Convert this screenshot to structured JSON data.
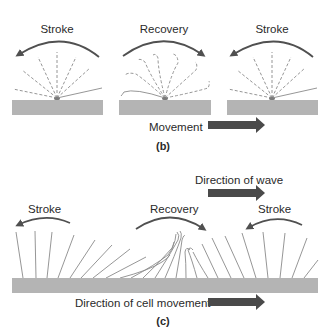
{
  "panel_b": {
    "caption": "(b)",
    "cells": [
      {
        "label": "Stroke",
        "arc_direction": "left"
      },
      {
        "label": "Recovery",
        "arc_direction": "right"
      },
      {
        "label": "Stroke",
        "arc_direction": "left"
      }
    ],
    "movement_label": "Movement",
    "movement_arrow_direction": "right"
  },
  "panel_c": {
    "caption": "(c)",
    "wave_label": "Direction of wave",
    "labels": {
      "stroke_left": "Stroke",
      "recovery": "Recovery",
      "stroke_right": "Stroke"
    },
    "cell_movement_label": "Direction of cell movement"
  },
  "colors": {
    "base_surface": "#b4b4b4",
    "cilia": "#8a8a8a",
    "arc_arrow": "#505050",
    "big_arrow": "#4a4a4a",
    "text": "#2a2a2a"
  }
}
